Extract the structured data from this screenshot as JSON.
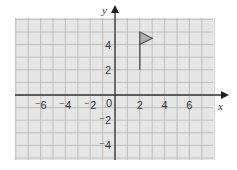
{
  "diagram": {
    "type": "coordinate-grid",
    "x_axis_label": "x",
    "y_axis_label": "y",
    "origin_label": "0",
    "x_tick_labels": [
      {
        "value": -6,
        "text": "⁻6"
      },
      {
        "value": -4,
        "text": "⁻4"
      },
      {
        "value": -2,
        "text": "⁻2"
      },
      {
        "value": 2,
        "text": "2"
      },
      {
        "value": 4,
        "text": "4"
      },
      {
        "value": 6,
        "text": "6"
      }
    ],
    "y_tick_labels": [
      {
        "value": 4,
        "text": "4"
      },
      {
        "value": 2,
        "text": "2"
      },
      {
        "value": -2,
        "text": "⁻2"
      },
      {
        "value": -4,
        "text": "⁻4"
      }
    ],
    "x_range": [
      -8,
      8
    ],
    "y_range": [
      -5.2,
      6.1
    ],
    "shape": {
      "name": "flag",
      "pole": [
        [
          2,
          2
        ],
        [
          2,
          5
        ]
      ],
      "triangle": [
        [
          2,
          5
        ],
        [
          3,
          4.5
        ],
        [
          2,
          4
        ]
      ]
    },
    "colors": {
      "grid_background": "#e6e6e6",
      "grid_line": "#b3b3b3",
      "axis": "#333333",
      "flag_fill": "#b0b0b0",
      "flag_stroke": "#555555"
    }
  }
}
